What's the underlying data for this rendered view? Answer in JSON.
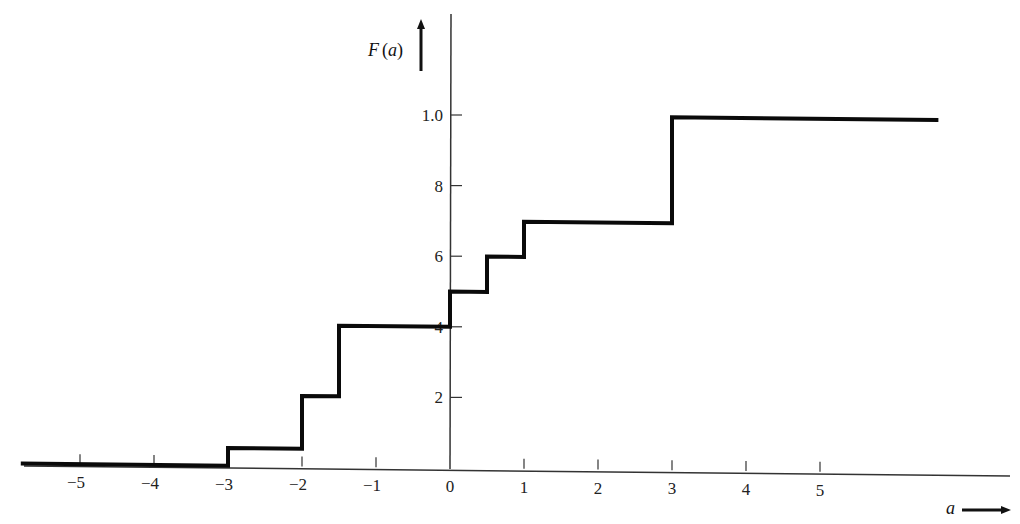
{
  "chart_data": {
    "type": "line",
    "subtype": "step",
    "title": "",
    "xlabel": "a",
    "ylabel": "F(a)",
    "xlim": [
      -5.8,
      7.5
    ],
    "ylim": [
      0,
      1.05
    ],
    "grid": false,
    "legend": null,
    "x_ticks": [
      "-5",
      "-4",
      "-3",
      "-2",
      "-1",
      "0",
      "1",
      "2",
      "3",
      "4",
      "5"
    ],
    "y_ticks": [
      {
        "value": 0.2,
        "label": "2"
      },
      {
        "value": 0.4,
        "label": "4"
      },
      {
        "value": 0.6,
        "label": "6"
      },
      {
        "value": 0.8,
        "label": "8"
      },
      {
        "value": 1.0,
        "label": "1.0"
      }
    ],
    "series": [
      {
        "name": "F(a)",
        "steps": [
          {
            "x_start": -5.8,
            "x_end": -3.0,
            "y": 0.0
          },
          {
            "x_start": -3.0,
            "x_end": -2.0,
            "y": 0.05
          },
          {
            "x_start": -2.0,
            "x_end": -1.5,
            "y": 0.2
          },
          {
            "x_start": -1.5,
            "x_end": 0.0,
            "y": 0.4
          },
          {
            "x_start": 0.0,
            "x_end": 0.5,
            "y": 0.5
          },
          {
            "x_start": 0.5,
            "x_end": 1.0,
            "y": 0.6
          },
          {
            "x_start": 1.0,
            "x_end": 3.0,
            "y": 0.7
          },
          {
            "x_start": 3.0,
            "x_end": 6.6,
            "y": 1.0
          }
        ]
      }
    ]
  },
  "labels": {
    "y_axis_title_italic": "F",
    "y_axis_title_paren": "(a)",
    "x_axis_title": "a"
  }
}
